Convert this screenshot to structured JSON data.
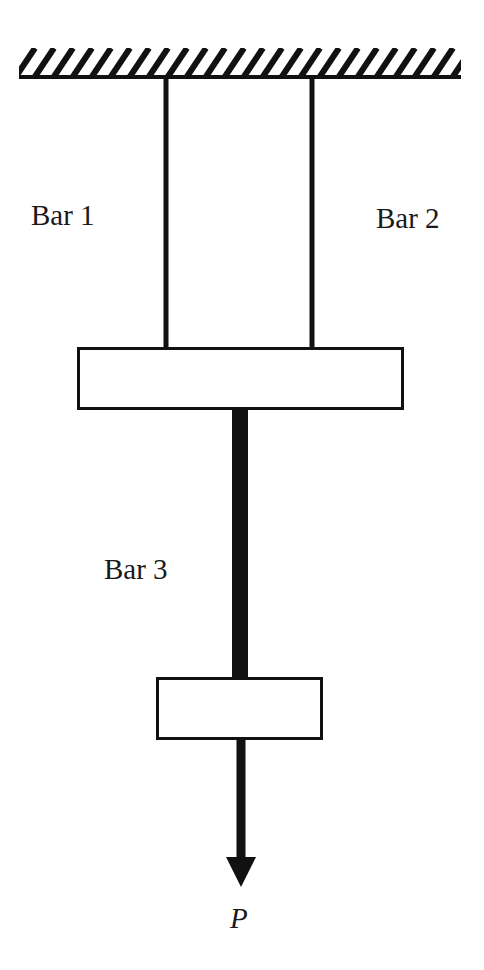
{
  "diagram": {
    "type": "structural-mechanics",
    "colors": {
      "stroke": "#111111",
      "fill": "#ffffff",
      "text": "#1a1a1a"
    },
    "support": {
      "name": "Fixed ceiling (hatched)",
      "x1": 19,
      "x2": 461,
      "y_top": 48,
      "y_base": 78
    },
    "bars": [
      {
        "id": "bar1",
        "label": "Bar 1",
        "x": 166,
        "y_top": 78,
        "y_bottom": 348,
        "width": 5
      },
      {
        "id": "bar2",
        "label": "Bar 2",
        "x": 312,
        "y_top": 78,
        "y_bottom": 348,
        "width": 5
      },
      {
        "id": "bar3",
        "label": "Bar 3",
        "x": 240,
        "y_top": 409,
        "y_bottom": 678,
        "width": 16
      }
    ],
    "plates": [
      {
        "id": "upper-plate",
        "x": 78,
        "y": 348,
        "width": 325,
        "height": 61
      },
      {
        "id": "lower-plate",
        "x": 157,
        "y": 678,
        "width": 165,
        "height": 61
      }
    ],
    "load": {
      "symbol": "P",
      "direction": "down",
      "x": 241,
      "shaft_top": 739,
      "shaft_bottom": 858,
      "tip_y": 887
    }
  },
  "labels": {
    "bar1": "Bar 1",
    "bar2": "Bar 2",
    "bar3": "Bar 3",
    "load": "P"
  }
}
